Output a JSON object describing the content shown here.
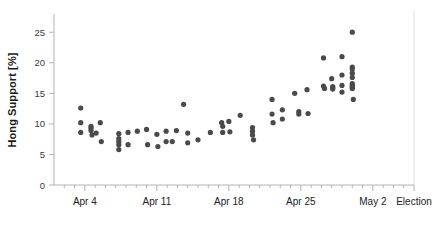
{
  "chart_data": {
    "type": "scatter",
    "title": "",
    "subtitle": "",
    "xlabel": "",
    "ylabel": "Hong Support [%]",
    "ylim": [
      0,
      27
    ],
    "yticks": [
      0,
      5,
      10,
      15,
      20,
      25
    ],
    "ytick_labels": [
      "0",
      "5",
      "10",
      "15",
      "20",
      "25"
    ],
    "xlim": [
      0,
      35
    ],
    "xticks": [
      3,
      10,
      17,
      24,
      31,
      35
    ],
    "xtick_labels": [
      "Apr 4",
      "Apr 11",
      "Apr 18",
      "Apr 25",
      "May 2",
      "Election"
    ],
    "x_minor_tick_step": 1,
    "grid": false,
    "legend": null,
    "marker": {
      "shape": "circle",
      "color": "#4a4a4a",
      "size_px": 2.6
    },
    "annotations": [
      {
        "name": "election-line",
        "type": "vline",
        "x": 35,
        "color": "#e0e0e0"
      }
    ],
    "axis_color": "#b4b4b4",
    "series": [
      {
        "name": "Hong Support Polls",
        "points": [
          [
            2.6,
            12.6
          ],
          [
            2.6,
            10.2
          ],
          [
            2.6,
            8.6
          ],
          [
            3.6,
            9.6
          ],
          [
            3.6,
            9.3
          ],
          [
            3.6,
            8.9
          ],
          [
            3.7,
            8.2
          ],
          [
            4.1,
            8.5
          ],
          [
            4.5,
            10.2
          ],
          [
            4.6,
            7.1
          ],
          [
            6.3,
            8.4
          ],
          [
            6.3,
            7.6
          ],
          [
            6.3,
            7.1
          ],
          [
            6.3,
            6.6
          ],
          [
            6.3,
            5.8
          ],
          [
            7.2,
            8.6
          ],
          [
            7.2,
            6.6
          ],
          [
            8.1,
            8.8
          ],
          [
            9.0,
            9.1
          ],
          [
            9.1,
            6.6
          ],
          [
            10.0,
            8.3
          ],
          [
            10.1,
            6.3
          ],
          [
            10.9,
            8.8
          ],
          [
            10.9,
            7.1
          ],
          [
            11.5,
            7.1
          ],
          [
            11.9,
            8.9
          ],
          [
            12.6,
            13.2
          ],
          [
            13.0,
            8.5
          ],
          [
            13.0,
            6.9
          ],
          [
            14.0,
            7.4
          ],
          [
            15.2,
            8.6
          ],
          [
            16.3,
            10.2
          ],
          [
            16.4,
            9.6
          ],
          [
            16.4,
            8.6
          ],
          [
            17.0,
            10.4
          ],
          [
            17.1,
            8.7
          ],
          [
            18.1,
            11.4
          ],
          [
            19.3,
            9.4
          ],
          [
            19.3,
            8.8
          ],
          [
            19.3,
            8.2
          ],
          [
            19.4,
            7.4
          ],
          [
            21.2,
            14.0
          ],
          [
            21.2,
            11.6
          ],
          [
            21.3,
            10.2
          ],
          [
            22.2,
            12.3
          ],
          [
            22.2,
            10.8
          ],
          [
            23.4,
            15.0
          ],
          [
            23.8,
            12.0
          ],
          [
            23.8,
            11.6
          ],
          [
            24.6,
            15.6
          ],
          [
            24.7,
            11.7
          ],
          [
            26.2,
            20.8
          ],
          [
            26.2,
            16.2
          ],
          [
            26.3,
            15.8
          ],
          [
            27.0,
            17.4
          ],
          [
            27.1,
            16.1
          ],
          [
            27.1,
            15.9
          ],
          [
            27.1,
            15.7
          ],
          [
            28.0,
            21.0
          ],
          [
            28.0,
            18.0
          ],
          [
            28.0,
            16.3
          ],
          [
            28.0,
            15.2
          ],
          [
            29.0,
            25.0
          ],
          [
            29.0,
            19.3
          ],
          [
            29.0,
            19.0
          ],
          [
            29.0,
            18.3
          ],
          [
            29.0,
            17.6
          ],
          [
            29.0,
            16.6
          ],
          [
            29.0,
            16.3
          ],
          [
            29.0,
            16.0
          ],
          [
            29.0,
            15.8
          ],
          [
            29.1,
            14.0
          ]
        ]
      }
    ]
  }
}
